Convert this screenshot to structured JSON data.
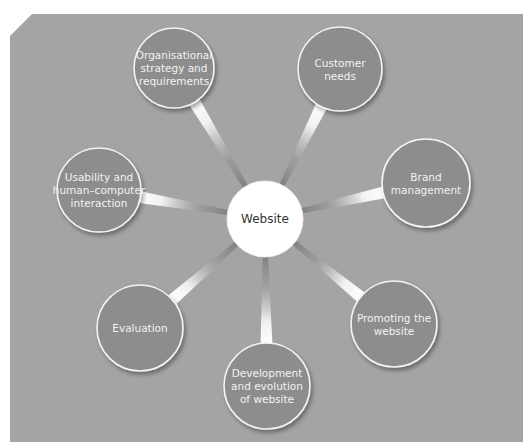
{
  "diagram": {
    "type": "hub-and-spoke",
    "colors": {
      "panel": "#a4a4a4",
      "satellite_fill": "#8d8d8d",
      "satellite_stroke": "#f4f4f4",
      "center_fill": "#ffffff",
      "spoke_light": "#ffffff",
      "spoke_dark": "#777777"
    },
    "center": {
      "label": "Website",
      "cx": 265,
      "cy": 219,
      "r": 38
    },
    "nodes": [
      {
        "id": "org",
        "lines": [
          "Organisational",
          "strategy and",
          "requirements"
        ],
        "cx": 174,
        "cy": 68,
        "r": 40
      },
      {
        "id": "customer",
        "lines": [
          "Customer",
          "needs"
        ],
        "cx": 340,
        "cy": 69,
        "r": 42
      },
      {
        "id": "brand",
        "lines": [
          "Brand",
          "management"
        ],
        "cx": 426,
        "cy": 183,
        "r": 44
      },
      {
        "id": "promoting",
        "lines": [
          "Promoting the",
          "website"
        ],
        "cx": 394,
        "cy": 324,
        "r": 43
      },
      {
        "id": "development",
        "lines": [
          "Development",
          "and evolution",
          "of website"
        ],
        "cx": 267,
        "cy": 386,
        "r": 43
      },
      {
        "id": "evaluation",
        "lines": [
          "Evaluation"
        ],
        "cx": 140,
        "cy": 328,
        "r": 43
      },
      {
        "id": "usability",
        "lines": [
          "Usability and",
          "human–computer",
          "interaction"
        ],
        "cx": 99,
        "cy": 190,
        "r": 42
      }
    ]
  }
}
